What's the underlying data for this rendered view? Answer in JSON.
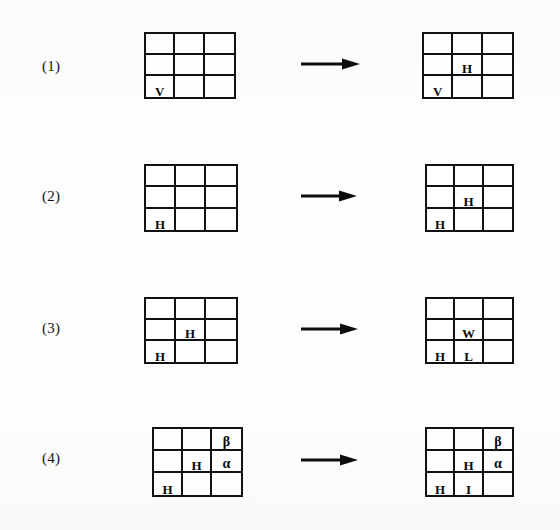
{
  "figure": {
    "background_color": "#fdfdfc",
    "ink_color": "#111111",
    "rows": [
      {
        "label": "(1)",
        "label_x": 42,
        "label_y": 58,
        "arrow": {
          "x": 300,
          "y": 57,
          "width": 60,
          "name": "arrow-right-icon"
        },
        "left_grid": {
          "x": 144,
          "y": 32,
          "w": 92,
          "h": 67,
          "cells": [
            {
              "r": 1,
              "c": 1,
              "text": ""
            },
            {
              "r": 1,
              "c": 2,
              "text": ""
            },
            {
              "r": 1,
              "c": 3,
              "text": ""
            },
            {
              "r": 2,
              "c": 1,
              "text": ""
            },
            {
              "r": 2,
              "c": 2,
              "text": ""
            },
            {
              "r": 2,
              "c": 3,
              "text": ""
            },
            {
              "r": 3,
              "c": 1,
              "text": "V"
            },
            {
              "r": 3,
              "c": 2,
              "text": ""
            },
            {
              "r": 3,
              "c": 3,
              "text": ""
            }
          ]
        },
        "right_grid": {
          "x": 422,
          "y": 32,
          "w": 92,
          "h": 67,
          "cells": [
            {
              "r": 1,
              "c": 1,
              "text": ""
            },
            {
              "r": 1,
              "c": 2,
              "text": ""
            },
            {
              "r": 1,
              "c": 3,
              "text": ""
            },
            {
              "r": 2,
              "c": 1,
              "text": ""
            },
            {
              "r": 2,
              "c": 2,
              "text": "H"
            },
            {
              "r": 2,
              "c": 3,
              "text": ""
            },
            {
              "r": 3,
              "c": 1,
              "text": "V"
            },
            {
              "r": 3,
              "c": 2,
              "text": ""
            },
            {
              "r": 3,
              "c": 3,
              "text": ""
            }
          ]
        }
      },
      {
        "label": "(2)",
        "label_x": 42,
        "label_y": 188,
        "arrow": {
          "x": 300,
          "y": 189,
          "width": 57,
          "name": "arrow-right-icon"
        },
        "left_grid": {
          "x": 144,
          "y": 164,
          "w": 94,
          "h": 68,
          "cells": [
            {
              "r": 1,
              "c": 1,
              "text": ""
            },
            {
              "r": 1,
              "c": 2,
              "text": ""
            },
            {
              "r": 1,
              "c": 3,
              "text": ""
            },
            {
              "r": 2,
              "c": 1,
              "text": ""
            },
            {
              "r": 2,
              "c": 2,
              "text": ""
            },
            {
              "r": 2,
              "c": 3,
              "text": ""
            },
            {
              "r": 3,
              "c": 1,
              "text": "H"
            },
            {
              "r": 3,
              "c": 2,
              "text": ""
            },
            {
              "r": 3,
              "c": 3,
              "text": ""
            }
          ]
        },
        "right_grid": {
          "x": 425,
          "y": 164,
          "w": 89,
          "h": 68,
          "cells": [
            {
              "r": 1,
              "c": 1,
              "text": ""
            },
            {
              "r": 1,
              "c": 2,
              "text": ""
            },
            {
              "r": 1,
              "c": 3,
              "text": ""
            },
            {
              "r": 2,
              "c": 1,
              "text": ""
            },
            {
              "r": 2,
              "c": 2,
              "text": "H"
            },
            {
              "r": 2,
              "c": 3,
              "text": ""
            },
            {
              "r": 3,
              "c": 1,
              "text": "H"
            },
            {
              "r": 3,
              "c": 2,
              "text": ""
            },
            {
              "r": 3,
              "c": 3,
              "text": ""
            }
          ]
        }
      },
      {
        "label": "(3)",
        "label_x": 42,
        "label_y": 320,
        "arrow": {
          "x": 300,
          "y": 322,
          "width": 58,
          "name": "arrow-right-icon"
        },
        "left_grid": {
          "x": 144,
          "y": 297,
          "w": 94,
          "h": 67,
          "cells": [
            {
              "r": 1,
              "c": 1,
              "text": ""
            },
            {
              "r": 1,
              "c": 2,
              "text": ""
            },
            {
              "r": 1,
              "c": 3,
              "text": ""
            },
            {
              "r": 2,
              "c": 1,
              "text": ""
            },
            {
              "r": 2,
              "c": 2,
              "text": "H"
            },
            {
              "r": 2,
              "c": 3,
              "text": ""
            },
            {
              "r": 3,
              "c": 1,
              "text": "H"
            },
            {
              "r": 3,
              "c": 2,
              "text": ""
            },
            {
              "r": 3,
              "c": 3,
              "text": ""
            }
          ]
        },
        "right_grid": {
          "x": 425,
          "y": 297,
          "w": 89,
          "h": 67,
          "cells": [
            {
              "r": 1,
              "c": 1,
              "text": ""
            },
            {
              "r": 1,
              "c": 2,
              "text": ""
            },
            {
              "r": 1,
              "c": 3,
              "text": ""
            },
            {
              "r": 2,
              "c": 1,
              "text": ""
            },
            {
              "r": 2,
              "c": 2,
              "text": "W"
            },
            {
              "r": 2,
              "c": 3,
              "text": ""
            },
            {
              "r": 3,
              "c": 1,
              "text": "H"
            },
            {
              "r": 3,
              "c": 2,
              "text": "L"
            },
            {
              "r": 3,
              "c": 3,
              "text": ""
            }
          ]
        }
      },
      {
        "label": "(4)",
        "label_x": 42,
        "label_y": 450,
        "arrow": {
          "x": 300,
          "y": 453,
          "width": 58,
          "name": "arrow-right-icon"
        },
        "left_grid": {
          "x": 152,
          "y": 427,
          "w": 91,
          "h": 70,
          "cells": [
            {
              "r": 1,
              "c": 1,
              "text": ""
            },
            {
              "r": 1,
              "c": 2,
              "text": ""
            },
            {
              "r": 1,
              "c": 3,
              "text": "β"
            },
            {
              "r": 2,
              "c": 1,
              "text": ""
            },
            {
              "r": 2,
              "c": 2,
              "text": "H"
            },
            {
              "r": 2,
              "c": 3,
              "text": "α"
            },
            {
              "r": 3,
              "c": 1,
              "text": "H"
            },
            {
              "r": 3,
              "c": 2,
              "text": ""
            },
            {
              "r": 3,
              "c": 3,
              "text": ""
            }
          ]
        },
        "right_grid": {
          "x": 425,
          "y": 427,
          "w": 89,
          "h": 70,
          "cells": [
            {
              "r": 1,
              "c": 1,
              "text": ""
            },
            {
              "r": 1,
              "c": 2,
              "text": ""
            },
            {
              "r": 1,
              "c": 3,
              "text": "β"
            },
            {
              "r": 2,
              "c": 1,
              "text": ""
            },
            {
              "r": 2,
              "c": 2,
              "text": "H"
            },
            {
              "r": 2,
              "c": 3,
              "text": "α"
            },
            {
              "r": 3,
              "c": 1,
              "text": "H"
            },
            {
              "r": 3,
              "c": 2,
              "text": "I"
            },
            {
              "r": 3,
              "c": 3,
              "text": ""
            }
          ]
        }
      }
    ]
  }
}
